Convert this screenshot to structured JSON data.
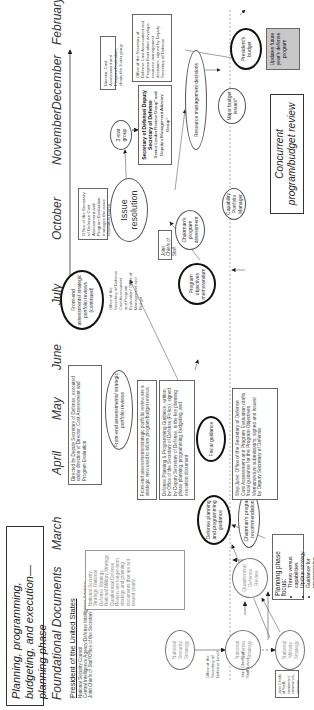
{
  "title": "Planning, programming, budgeting, and execution—planning phase",
  "foundational_heading": "Foundational Documents",
  "months": [
    "March",
    "April",
    "May",
    "June",
    "July",
    "October",
    "November",
    "December",
    "February"
  ],
  "president": {
    "heading": "President of the United States",
    "lines": [
      "National Security Council",
      "Central Intelligence Agency/Defense Intelligence Agency/",
      "Joint Chiefs of Staff/Office of the Secretary of Defense"
    ]
  },
  "row_labels": {
    "osd_level": "Office of the Secretary of Defense Level",
    "jcs_level": "Joint Chiefs of Staff Level"
  },
  "ovals": {
    "nss": "National Security Strategy",
    "nds": "National Defense Strategy",
    "qdr": "Quadrennial Defense Review",
    "nms": "National Military Strategy",
    "dppg": "Defense planning and programming guidance",
    "fea1": "Front-end assessments/ strategic portfolio reviews",
    "fiscal": "Fiscal guidance",
    "cpr": "Chairman's program recommendation",
    "fea2": "Front-end assessments/ strategic portfolio reviews (continued)",
    "pom": "Program objectives memorandum",
    "issue": "Issue resolution",
    "cpa": "Chairman's program assessment",
    "cpm": "Capability Portfolio Manager",
    "three_star": "3-star group",
    "rmd": "Resource management decisions",
    "mbi": "Major budget issues*",
    "pb": "President's budget"
  },
  "boxes": {
    "foundational_note": "National Security Strategy, National Defense Strategy, National Military Strategy, Quadrennial Defense Review are longer-term strategy and planning documents that are not issued yearly.",
    "directed_by": "Directed by Deputy Secretary of Defense, executed under direction of Director, Cost Assessment and Program Evaluation",
    "fea_note": "Front-end assessments/strategic portfolio review are a strategic view used to inform program/budget reviews.",
    "dppg_note": "Defense Planning & Programming Guidance, written by Office of the Secretary of Defense (Policy), signed by Deputy Secretary of Defense, is the key planning phase planning, programming, budgeting, and execution document",
    "mayjune_note": "May/June: Office of the Secretary of Defense Cost Assessment and Program Evaluation drafts fiscal guidance for the Program Objectives Memorandum submissions; signed and issued by Deputy Secretary of Defense",
    "osd_cape_mgmt": "Office of the Secretary of Defense Cost Assessment and Program Evaluation/ Office of Management and Budget",
    "osd_cape_issue": "Office of the Secretary of Defense Cost Assessment and Program Evaluation manages the issue resolution teams",
    "secdef_title": "Secretary of Defense/ Deputy Secretary of Defense",
    "secdef_sub": "Senior Leader Review Group* and Deputy's Management Advisory Group*",
    "director_cape": "Director, Cost Assessment and Program Evaluation, chairs the 3-star group",
    "osd_cape_rmd": "Office of the Secretary of Defense Cost Assessment and Program Evaluation develops resource management decisions, signed by Deputy Secretary of Defense",
    "jcs_label": "Joint Chiefs of Staff",
    "jcs_combatant": "Joint Chiefs of Staff, combatant commands, services",
    "updates": "Updates future year's defense program"
  },
  "planning_focus": {
    "heading": "Planning phase focus:",
    "items": [
      "Threat versus capabilities",
      "Update strategy",
      "Guidance for programming"
    ]
  },
  "concurrent": "Concurrent program/budget review"
}
